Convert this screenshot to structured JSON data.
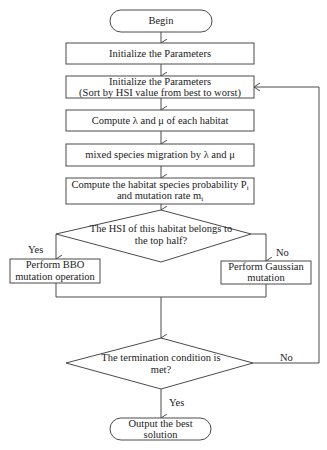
{
  "flowchart": {
    "start": {
      "label": "Begin"
    },
    "steps": [
      {
        "id": "init",
        "lines": [
          "Initialize the Parameters"
        ]
      },
      {
        "id": "sort",
        "lines": [
          "Initialize the Parameters",
          "(Sort by HSI  value from best to worst)"
        ]
      },
      {
        "id": "compute_rates",
        "lines": [
          "Compute  λ and μ of each habitat"
        ]
      },
      {
        "id": "migration",
        "lines": [
          "mixed  species migration  by λ and μ"
        ]
      },
      {
        "id": "probability",
        "lines": [
          "Compute  the habitat  species  probability P",
          "and   mutation rate  m"
        ],
        "subscripts": [
          "i",
          "i"
        ]
      }
    ],
    "decision1": {
      "lines": [
        "The HSI of this habitat belongs to",
        "the top half?"
      ],
      "yes_label": "Yes",
      "no_label": "No"
    },
    "branch_yes": {
      "lines": [
        "Perform  BBO",
        "mutation operation"
      ]
    },
    "branch_no": {
      "lines": [
        "Perform  Gaussian",
        "mutation"
      ]
    },
    "decision2": {
      "lines": [
        "The termination condition is",
        "met?"
      ],
      "yes_label": "Yes",
      "no_label": "No"
    },
    "end": {
      "lines": [
        "Output the best",
        "solution"
      ]
    }
  },
  "colors": {
    "stroke": "#4a4a4a",
    "fill": "#ffffff",
    "text": "#222222"
  }
}
